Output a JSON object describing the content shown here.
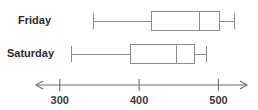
{
  "chart_data": {
    "type": "box",
    "title": "",
    "xlabel": "",
    "ylabel": "",
    "orientation": "horizontal",
    "axis": {
      "min": 270,
      "max": 536,
      "ticks": [
        300,
        400,
        500
      ],
      "tick_labels": [
        "300",
        "400",
        "500"
      ],
      "arrows_both_ends": true,
      "grid": false
    },
    "categories": [
      "Friday",
      "Saturday"
    ],
    "boxes": [
      {
        "category": "Friday",
        "min": 342,
        "q1": 415,
        "median": 475,
        "q3": 502,
        "max": 520
      },
      {
        "category": "Saturday",
        "min": 314,
        "q1": 388,
        "median": 447,
        "q3": 470,
        "max": 484
      }
    ],
    "legend": [],
    "annotations": []
  },
  "colors": {
    "background": "#ffffff",
    "line": "#8c8c8c",
    "axis": "#6e6e6e",
    "label_text": "#2b2b2b",
    "tick_text": "#3a3a3a"
  },
  "labels": {
    "friday": "Friday",
    "saturday": "Saturday"
  },
  "ticks": {
    "t300": "300",
    "t400": "400",
    "t500": "500"
  }
}
